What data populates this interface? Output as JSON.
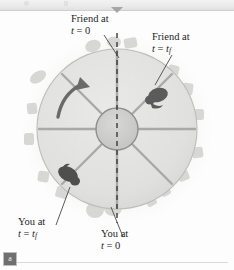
{
  "figure": {
    "panel_label": "a",
    "caption_labels": {
      "friend_t0": {
        "line1": "Friend at",
        "var": "t",
        "eq": "= 0"
      },
      "friend_tf": {
        "line1": "Friend at",
        "var": "t",
        "eq": "=",
        "value": "t",
        "value_sub": "f"
      },
      "you_tf": {
        "line1": "You at",
        "var": "t",
        "eq": "=",
        "value": "t",
        "value_sub": "f"
      },
      "you_t0": {
        "line1": "You at",
        "var": "t",
        "eq": "= 0"
      }
    },
    "icons": {
      "top_marker": "triangle-down-icon",
      "rotation_arrow": "curved-rotation-arrow-icon",
      "friend_figure": "person-figure-icon",
      "you_figure": "person-figure-icon"
    },
    "diagram": {
      "subject": "rotating merry-go-round viewed from above",
      "spoke_count": 8,
      "hub_radius": 21,
      "platform_radius": 80,
      "dashed_reference_line": "vertical",
      "rotation_sense": "counterclockwise"
    },
    "colors": {
      "platform_fill": "#e2e2e0",
      "platform_edge": "#bdbdbb",
      "hub_fill": "#cfcfcd",
      "hub_edge": "#8f8f8d",
      "spoke": "#a9a9a6",
      "dashed_line": "#3a3a3a",
      "figure_dark": "#5b5b5b",
      "blob": "#d5d5d3",
      "label_text": "#1d1d1d",
      "leader_line": "#4a4a4a",
      "badge_bg": "#6f6f6f",
      "top_strip": "#eaeaea"
    }
  }
}
